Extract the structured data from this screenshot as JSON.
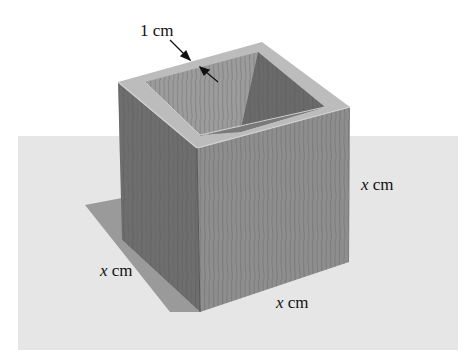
{
  "diagram": {
    "labels": {
      "wall_thickness": {
        "text": "1 cm"
      },
      "height": {
        "var": "x",
        "unit": " cm"
      },
      "depth": {
        "var": "x",
        "unit": " cm"
      },
      "width": {
        "var": "x",
        "unit": " cm"
      }
    },
    "colors": {
      "ground": "#e6e6e6",
      "shadow": "#9a9a9a",
      "left_face": "#6e6e6e",
      "front_face": "#8e8e8e",
      "rim": "#b9b9b9",
      "inner_back_left": "#9c9c9c",
      "inner_back_right": "#6a6a6a",
      "grain": "#5a5a5a",
      "arrow": "#111111"
    }
  }
}
